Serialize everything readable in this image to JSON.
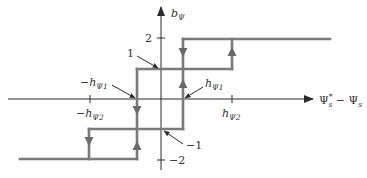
{
  "diagram": {
    "type": "hysteresis-characteristic",
    "y_axis_label": "b",
    "y_axis_label_sub": "Ψ",
    "x_axis_label_main": "Ψ",
    "x_axis_label_sup": "*",
    "x_axis_label_sub": "s",
    "x_axis_label_minus": " − Ψ",
    "x_axis_label_sub2": "s",
    "y_ticks": [
      {
        "label": "2",
        "value": 2
      },
      {
        "label": "−2",
        "value": -2
      }
    ],
    "x_ticks": [
      {
        "label_prefix": "−h",
        "label_sub": "Ψ2",
        "value": "-hΨ2"
      },
      {
        "label_prefix": "h",
        "label_sub": "Ψ2",
        "value": "hΨ2"
      }
    ],
    "annotations": [
      {
        "id": "level-1",
        "text": "1"
      },
      {
        "id": "level-minus-1",
        "text": "−1"
      },
      {
        "id": "minus-h1",
        "label_prefix": "−h",
        "label_sub": "Ψ1"
      },
      {
        "id": "plus-h1",
        "label_prefix": "h",
        "label_sub": "Ψ1"
      }
    ],
    "levels": [
      -2,
      -1,
      1,
      2
    ],
    "colors": {
      "axis": "#2a2a2a",
      "curve": "#7a7a7a",
      "text": "#333333"
    }
  }
}
